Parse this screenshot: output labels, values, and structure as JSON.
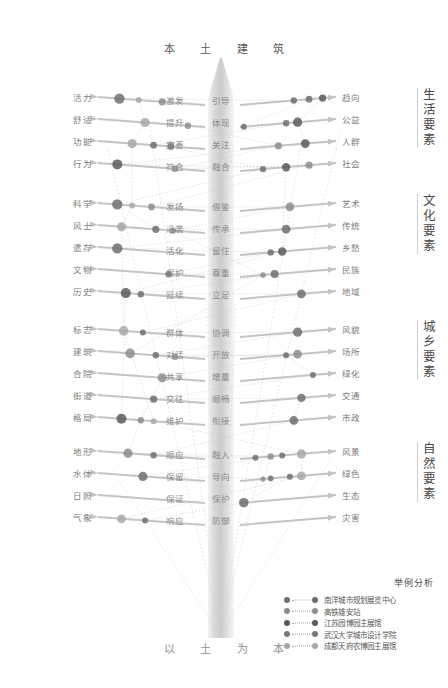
{
  "title": {
    "top": "本 土 建 筑",
    "bottom": "以 土 为 本"
  },
  "colors": {
    "series": [
      "#6e6e6e",
      "#8d8d8d",
      "#a8a8a8",
      "#5a5a5a",
      "#c2c2c2"
    ],
    "arrow": "#c4c4c4",
    "dotted": "#c9c9c9",
    "text": "#7c7c7c",
    "trunk_light": "#f3f3f3",
    "trunk_dark": "#c9c9c9"
  },
  "sections": [
    {
      "name": "生活要素",
      "chars": [
        "生",
        "活",
        "要",
        "素"
      ],
      "top": 98,
      "rows": [
        {
          "left": "活力",
          "mid_left": "激发",
          "mid_right": "引导",
          "right": "趋向"
        },
        {
          "left": "舒适",
          "mid_left": "提升",
          "mid_right": "体现",
          "right": "公益"
        },
        {
          "left": "功能",
          "mid_left": "完善",
          "mid_right": "关注",
          "right": "人群"
        },
        {
          "left": "行为",
          "mid_left": "符合",
          "mid_right": "融合",
          "right": "社会"
        }
      ]
    },
    {
      "name": "文化要素",
      "chars": [
        "文",
        "化",
        "要",
        "素"
      ],
      "top": 204,
      "rows": [
        {
          "left": "科学",
          "mid_left": "发扬",
          "mid_right": "借鉴",
          "right": "艺术"
        },
        {
          "left": "风土",
          "mid_left": "沿袭",
          "mid_right": "传承",
          "right": "传统"
        },
        {
          "left": "遗存",
          "mid_left": "活化",
          "mid_right": "留住",
          "right": "乡愁"
        },
        {
          "left": "文物",
          "mid_left": "保护",
          "mid_right": "尊重",
          "right": "民族"
        },
        {
          "left": "历史",
          "mid_left": "延续",
          "mid_right": "立足",
          "right": "地域"
        }
      ]
    },
    {
      "name": "城乡要素",
      "chars": [
        "城",
        "乡",
        "要",
        "素"
      ],
      "top": 330,
      "rows": [
        {
          "left": "标志",
          "mid_left": "群体",
          "mid_right": "协调",
          "right": "风貌"
        },
        {
          "left": "建筑",
          "mid_left": "对话",
          "mid_right": "开放",
          "right": "场所"
        },
        {
          "left": "合院",
          "mid_left": "共享",
          "mid_right": "增量",
          "right": "绿化"
        },
        {
          "left": "街道",
          "mid_left": "交往",
          "mid_right": "顺畅",
          "right": "交通"
        },
        {
          "left": "格局",
          "mid_left": "维护",
          "mid_right": "衔接",
          "right": "市政"
        }
      ]
    },
    {
      "name": "自然要素",
      "chars": [
        "自",
        "然",
        "要",
        "素"
      ],
      "top": 452,
      "rows": [
        {
          "left": "地形",
          "mid_left": "顺应",
          "mid_right": "融入",
          "right": "风景"
        },
        {
          "left": "水体",
          "mid_left": "保留",
          "mid_right": "导向",
          "right": "绿色"
        },
        {
          "left": "日照",
          "mid_left": "保证",
          "mid_right": "保护",
          "right": "生态"
        },
        {
          "left": "气象",
          "mid_left": "响应",
          "mid_right": "防御",
          "right": "灾害"
        }
      ]
    }
  ],
  "legend": {
    "title": "举例分析",
    "items": [
      {
        "label": "南洋城市规划展览中心",
        "color": "#6e6e6e"
      },
      {
        "label": "高铁雄安站",
        "color": "#8d8d8d"
      },
      {
        "label": "江苏园博园主展馆",
        "color": "#5a5a5a"
      },
      {
        "label": "武汉大学城市设计学院",
        "color": "#7a7a7a"
      },
      {
        "label": "成都天府农博园主展馆",
        "color": "#a8a8a8"
      }
    ]
  },
  "chart_data": {
    "type": "scatter",
    "marker_rows": [
      {
        "row": "活力",
        "markers": [
          {
            "t": 0.1,
            "r": 5.2,
            "c": 0
          },
          {
            "t": 0.19,
            "r": 3.0,
            "c": 2
          },
          {
            "t": 0.3,
            "r": 3.6,
            "c": 1
          },
          {
            "t": 0.78,
            "r": 3.2,
            "c": 0
          },
          {
            "t": 0.86,
            "r": 3.4,
            "c": 0
          },
          {
            "t": 0.93,
            "r": 3.6,
            "c": 3
          }
        ]
      },
      {
        "row": "舒适",
        "markers": [
          {
            "t": 0.22,
            "r": 4.6,
            "c": 2
          },
          {
            "t": 0.42,
            "r": 3.2,
            "c": 1
          },
          {
            "t": 0.52,
            "r": 3.0,
            "c": 0
          },
          {
            "t": 0.74,
            "r": 3.2,
            "c": 0
          },
          {
            "t": 0.8,
            "r": 4.6,
            "c": 3
          }
        ]
      },
      {
        "row": "功能",
        "markers": [
          {
            "t": 0.16,
            "r": 4.6,
            "c": 2
          },
          {
            "t": 0.26,
            "r": 3.4,
            "c": 0
          },
          {
            "t": 0.34,
            "r": 3.4,
            "c": 0
          },
          {
            "t": 0.7,
            "r": 3.6,
            "c": 1
          },
          {
            "t": 0.84,
            "r": 4.4,
            "c": 3
          }
        ]
      },
      {
        "row": "行为",
        "markers": [
          {
            "t": 0.09,
            "r": 5.0,
            "c": 3
          },
          {
            "t": 0.36,
            "r": 3.2,
            "c": 1
          },
          {
            "t": 0.62,
            "r": 3.2,
            "c": 0
          },
          {
            "t": 0.74,
            "r": 4.2,
            "c": 3
          },
          {
            "t": 0.86,
            "r": 3.6,
            "c": 1
          }
        ]
      },
      {
        "row": "科学",
        "markers": [
          {
            "t": 0.09,
            "r": 5.2,
            "c": 0
          },
          {
            "t": 0.16,
            "r": 3.0,
            "c": 2
          },
          {
            "t": 0.25,
            "r": 3.4,
            "c": 1
          },
          {
            "t": 0.76,
            "r": 4.4,
            "c": 1
          }
        ]
      },
      {
        "row": "风土",
        "markers": [
          {
            "t": 0.11,
            "r": 4.6,
            "c": 2
          },
          {
            "t": 0.27,
            "r": 3.6,
            "c": 0
          },
          {
            "t": 0.35,
            "r": 3.2,
            "c": 1
          },
          {
            "t": 0.74,
            "r": 4.4,
            "c": 0
          }
        ]
      },
      {
        "row": "遗存",
        "markers": [
          {
            "t": 0.09,
            "r": 5.2,
            "c": 0
          },
          {
            "t": 0.66,
            "r": 3.2,
            "c": 0
          },
          {
            "t": 0.72,
            "r": 4.2,
            "c": 3
          }
        ]
      },
      {
        "row": "文物",
        "markers": [
          {
            "t": 0.33,
            "r": 3.2,
            "c": 0
          },
          {
            "t": 0.62,
            "r": 2.8,
            "c": 1
          },
          {
            "t": 0.68,
            "r": 4.0,
            "c": 0
          }
        ]
      },
      {
        "row": "历史",
        "markers": [
          {
            "t": 0.13,
            "r": 5.0,
            "c": 3
          },
          {
            "t": 0.2,
            "r": 3.2,
            "c": 0
          },
          {
            "t": 0.82,
            "r": 4.4,
            "c": 0
          }
        ]
      },
      {
        "row": "标志",
        "markers": [
          {
            "t": 0.12,
            "r": 4.8,
            "c": 2
          },
          {
            "t": 0.21,
            "r": 3.0,
            "c": 0
          },
          {
            "t": 0.8,
            "r": 4.6,
            "c": 0
          }
        ]
      },
      {
        "row": "建筑",
        "markers": [
          {
            "t": 0.15,
            "r": 4.8,
            "c": 1
          },
          {
            "t": 0.27,
            "r": 3.2,
            "c": 0
          },
          {
            "t": 0.36,
            "r": 3.2,
            "c": 1
          },
          {
            "t": 0.74,
            "r": 3.0,
            "c": 0
          },
          {
            "t": 0.8,
            "r": 4.4,
            "c": 1
          }
        ]
      },
      {
        "row": "合院",
        "markers": [
          {
            "t": 0.3,
            "r": 4.6,
            "c": 1
          },
          {
            "t": 0.88,
            "r": 3.0,
            "c": 0
          }
        ]
      },
      {
        "row": "街道",
        "markers": [
          {
            "t": 0.26,
            "r": 3.6,
            "c": 0
          },
          {
            "t": 0.82,
            "r": 4.2,
            "c": 0
          }
        ]
      },
      {
        "row": "格局",
        "markers": [
          {
            "t": 0.11,
            "r": 5.0,
            "c": 3
          },
          {
            "t": 0.2,
            "r": 3.2,
            "c": 1
          },
          {
            "t": 0.26,
            "r": 3.0,
            "c": 2
          },
          {
            "t": 0.78,
            "r": 4.4,
            "c": 0
          }
        ]
      },
      {
        "row": "地形",
        "markers": [
          {
            "t": 0.14,
            "r": 4.6,
            "c": 1
          },
          {
            "t": 0.26,
            "r": 3.2,
            "c": 0
          },
          {
            "t": 0.58,
            "r": 3.0,
            "c": 0
          },
          {
            "t": 0.66,
            "r": 3.2,
            "c": 1
          },
          {
            "t": 0.72,
            "r": 3.0,
            "c": 0
          },
          {
            "t": 0.82,
            "r": 4.6,
            "c": 2
          }
        ]
      },
      {
        "row": "水体",
        "markers": [
          {
            "t": 0.21,
            "r": 4.6,
            "c": 0
          },
          {
            "t": 0.62,
            "r": 2.6,
            "c": 1
          },
          {
            "t": 0.66,
            "r": 2.8,
            "c": 0
          },
          {
            "t": 0.76,
            "r": 3.0,
            "c": 0
          },
          {
            "t": 0.82,
            "r": 4.4,
            "c": 2
          }
        ]
      },
      {
        "row": "日照",
        "markers": [
          {
            "t": 0.52,
            "r": 4.8,
            "c": 0
          }
        ]
      },
      {
        "row": "气象",
        "markers": [
          {
            "t": 0.11,
            "r": 4.4,
            "c": 2
          },
          {
            "t": 0.22,
            "r": 3.0,
            "c": 0
          }
        ]
      }
    ]
  }
}
